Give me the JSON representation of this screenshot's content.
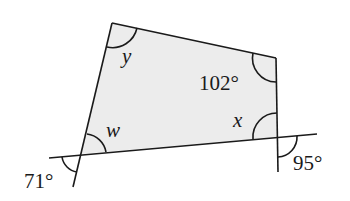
{
  "diagram": {
    "type": "quadrilateral-angles",
    "fill_color": "#ececec",
    "stroke_color": "#1a1a1a",
    "vertices": {
      "top_left": [
        112,
        23
      ],
      "top_right": [
        276,
        58
      ],
      "bottom_right": [
        277,
        137
      ],
      "bottom_left": [
        81,
        154
      ]
    },
    "labels": {
      "y": "y",
      "angle_102": "102°",
      "x": "x",
      "w": "w",
      "angle_71": "71°",
      "angle_95": "95°"
    }
  }
}
